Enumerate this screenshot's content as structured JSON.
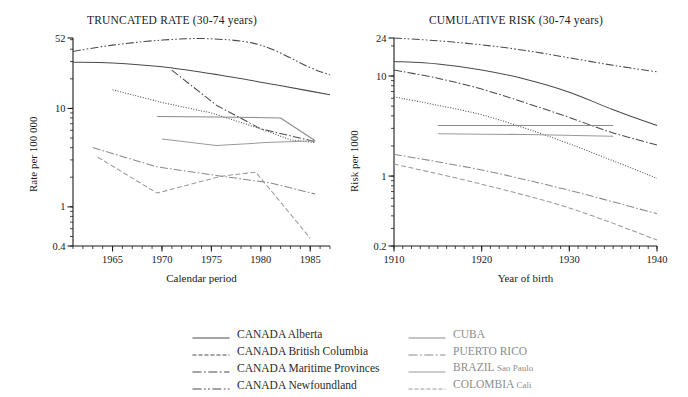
{
  "figure": {
    "legend": {
      "columns": [
        [
          {
            "label": "CANADA Alberta",
            "prefix": "CANADA",
            "suffix": "Alberta",
            "style": "solid",
            "color": "#4a4a4a"
          },
          {
            "label": "CANADA British Columbia",
            "prefix": "CANADA",
            "suffix": "British Columbia",
            "style": "dashed",
            "color": "#4a4a4a"
          },
          {
            "label": "CANADA Maritime Provinces",
            "prefix": "CANADA",
            "suffix": "Maritime Provinces",
            "style": "dashdot",
            "color": "#4a4a4a"
          },
          {
            "label": "CANADA Newfoundland",
            "prefix": "CANADA",
            "suffix": "Newfoundland",
            "style": "dashdotdot",
            "color": "#4a4a4a"
          }
        ],
        [
          {
            "label": "CUBA",
            "prefix": "CUBA",
            "suffix": "",
            "style": "solid",
            "color": "#8a8a8a"
          },
          {
            "label": "PUERTO RICO",
            "prefix": "PUERTO RICO",
            "suffix": "",
            "style": "dashdot",
            "color": "#8a8a8a"
          },
          {
            "label": "BRAZIL Sao Paulo",
            "prefix": "BRAZIL",
            "suffix": "Sao Paulo",
            "style": "solid",
            "color": "#9a9a9a"
          },
          {
            "label": "COLOMBIA Cali",
            "prefix": "COLOMBIA",
            "suffix": "Cali",
            "style": "dashed",
            "color": "#9a9a9a"
          }
        ]
      ]
    }
  },
  "chart_data": [
    {
      "id": "truncated-rate",
      "type": "line",
      "title": "TRUNCATED RATE (30-74 years)",
      "xlabel": "Calendar period",
      "ylabel": "Rate per 100 000",
      "yscale": "log",
      "ylim": [
        0.4,
        52
      ],
      "yticks": [
        0.4,
        1,
        10,
        52
      ],
      "yticklabels": [
        "0.4",
        "1",
        "10",
        "52"
      ],
      "xlim": [
        1961,
        1987
      ],
      "xticks": [
        1965,
        1970,
        1975,
        1980,
        1985
      ],
      "xticklabels": [
        "1965",
        "1970",
        "1975",
        "1980",
        "1985"
      ],
      "grid": false,
      "legend_position": "below-figure",
      "series": [
        {
          "name": "CANADA Alberta",
          "style": "solid",
          "color": "#4a4a4a",
          "x": [
            1961,
            1965,
            1970,
            1975,
            1980,
            1985,
            1987
          ],
          "y": [
            29.5,
            29.0,
            26.5,
            22.5,
            18.5,
            15.0,
            13.8
          ]
        },
        {
          "name": "CANADA British Columbia",
          "style": "dotted",
          "color": "#4a4a4a",
          "x": [
            1965,
            1970,
            1975,
            1980,
            1983,
            1985.5
          ],
          "y": [
            15.5,
            11.5,
            9.0,
            6.2,
            4.8,
            4.5
          ]
        },
        {
          "name": "CANADA Maritime Provinces",
          "style": "dashdot",
          "color": "#4a4a4a",
          "x": [
            1971,
            1975.5,
            1980,
            1985.5
          ],
          "y": [
            24.5,
            10.8,
            6.2,
            4.6
          ]
        },
        {
          "name": "CANADA Newfoundland",
          "style": "dashdotdot",
          "color": "#4a4a4a",
          "x": [
            1961,
            1965,
            1970,
            1975,
            1980,
            1985,
            1987
          ],
          "y": [
            38.0,
            44.0,
            49.5,
            51.0,
            44.0,
            26.0,
            22.0
          ]
        },
        {
          "name": "CUBA",
          "style": "solid",
          "color": "#8a8a8a",
          "x": [
            1969.5,
            1975.5,
            1982,
            1985.5
          ],
          "y": [
            8.3,
            8.2,
            8.0,
            4.7
          ]
        },
        {
          "name": "PUERTO RICO",
          "style": "dashdot",
          "color": "#8a8a8a",
          "x": [
            1963,
            1969.5,
            1976,
            1981,
            1985.5
          ],
          "y": [
            4.0,
            2.55,
            2.05,
            1.75,
            1.35
          ]
        },
        {
          "name": "BRAZIL Sao Paulo",
          "style": "solid",
          "color": "#9a9a9a",
          "x": [
            1970,
            1975.5,
            1980.5,
            1985.5
          ],
          "y": [
            4.9,
            4.2,
            4.5,
            4.7
          ]
        },
        {
          "name": "COLOMBIA Cali",
          "style": "dashed",
          "color": "#9a9a9a",
          "x": [
            1963.5,
            1969.5,
            1976,
            1979.5,
            1985
          ],
          "y": [
            3.2,
            1.38,
            2.05,
            2.25,
            0.48
          ]
        }
      ]
    },
    {
      "id": "cumulative-risk",
      "type": "line",
      "title": "CUMULATIVE RISK (30-74 years)",
      "xlabel": "Year of birth",
      "ylabel": "Risk per 1000",
      "yscale": "log",
      "ylim": [
        0.2,
        24
      ],
      "yticks": [
        0.2,
        1,
        10,
        24
      ],
      "yticklabels": [
        "0.2",
        "1",
        "10",
        "24"
      ],
      "xlim": [
        1910,
        1940
      ],
      "xticks": [
        1910,
        1920,
        1930,
        1940
      ],
      "xticklabels": [
        "1910",
        "1920",
        "1930",
        "1940"
      ],
      "grid": false,
      "legend_position": "below-figure",
      "series": [
        {
          "name": "CANADA Alberta",
          "style": "solid",
          "color": "#4a4a4a",
          "x": [
            1910,
            1915,
            1920,
            1925,
            1930,
            1935,
            1940
          ],
          "y": [
            14.0,
            13.2,
            11.5,
            9.3,
            6.9,
            4.6,
            3.2
          ]
        },
        {
          "name": "CANADA British Columbia",
          "style": "dotted",
          "color": "#4a4a4a",
          "x": [
            1910,
            1915,
            1920,
            1925,
            1930,
            1935,
            1940
          ],
          "y": [
            6.2,
            5.1,
            4.1,
            3.0,
            2.1,
            1.42,
            0.95
          ]
        },
        {
          "name": "CANADA Maritime Provinces",
          "style": "dashdot",
          "color": "#4a4a4a",
          "x": [
            1910,
            1915,
            1920,
            1925,
            1930,
            1935,
            1940
          ],
          "y": [
            11.5,
            9.5,
            7.4,
            5.4,
            3.85,
            2.7,
            2.05
          ]
        },
        {
          "name": "CANADA Newfoundland",
          "style": "dashdotdot",
          "color": "#4a4a4a",
          "x": [
            1910,
            1915,
            1920,
            1925,
            1930,
            1935,
            1940
          ],
          "y": [
            24.0,
            22.5,
            20.5,
            18.0,
            15.2,
            12.8,
            11.0
          ]
        },
        {
          "name": "CUBA",
          "style": "solid",
          "color": "#8a8a8a",
          "x": [
            1915,
            1925,
            1935
          ],
          "y": [
            3.2,
            3.2,
            3.2
          ]
        },
        {
          "name": "PUERTO RICO",
          "style": "dashdot",
          "color": "#8a8a8a",
          "x": [
            1910,
            1920,
            1930,
            1940
          ],
          "y": [
            1.65,
            1.15,
            0.72,
            0.42
          ]
        },
        {
          "name": "BRAZIL Sao Paulo",
          "style": "solid",
          "color": "#9a9a9a",
          "x": [
            1915,
            1925,
            1935
          ],
          "y": [
            2.65,
            2.6,
            2.5
          ]
        },
        {
          "name": "COLOMBIA Cali",
          "style": "dashed",
          "color": "#9a9a9a",
          "x": [
            1910,
            1920,
            1930,
            1940
          ],
          "y": [
            1.32,
            0.83,
            0.48,
            0.23
          ]
        }
      ]
    }
  ]
}
